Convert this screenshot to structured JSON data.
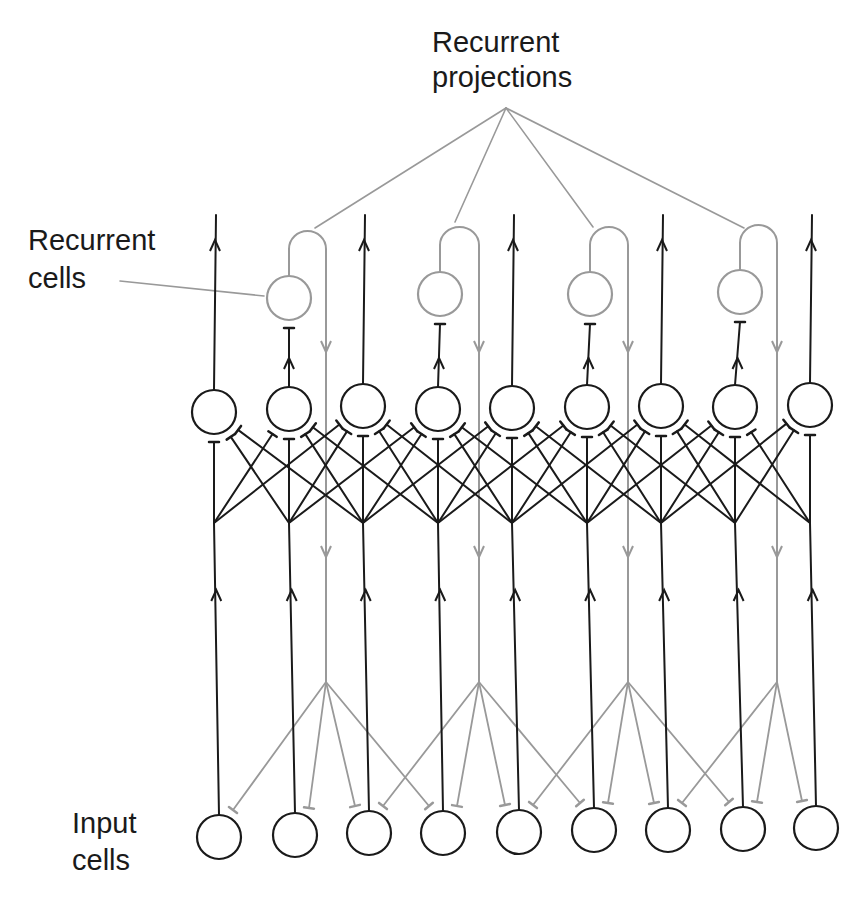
{
  "labels": {
    "recurrent_projections": [
      "Recurrent",
      "projections"
    ],
    "recurrent_cells": [
      "Recurrent",
      "cells"
    ],
    "input_cells": [
      "Input",
      "cells"
    ]
  },
  "colors": {
    "primary_stroke": "#1a1a1a",
    "recurrent_stroke": "#999999"
  },
  "layout": {
    "middle_cells_x": [
      214,
      289,
      363,
      438,
      512,
      587,
      661,
      735,
      810
    ],
    "middle_cells_y": [
      412,
      409,
      406,
      409,
      408,
      407,
      406,
      407,
      405
    ],
    "input_cells_x": [
      219,
      295,
      369,
      443,
      519,
      594,
      668,
      743,
      816
    ],
    "input_cells_y": [
      837,
      835,
      833,
      833,
      832,
      830,
      830,
      829,
      828
    ],
    "recurrent_cells": [
      {
        "x": 289,
        "y": 298,
        "loop_x": 326,
        "source_col": 1
      },
      {
        "x": 440,
        "y": 294,
        "loop_x": 479,
        "source_col": 3
      },
      {
        "x": 590,
        "y": 294,
        "loop_x": 628,
        "source_col": 5
      },
      {
        "x": 740,
        "y": 292,
        "loop_x": 777,
        "source_col": 7
      }
    ],
    "projection_apex": {
      "x": 506,
      "y": 108
    },
    "projection_targets": [
      [
        315,
        228
      ],
      [
        455,
        222
      ],
      [
        593,
        227
      ],
      [
        744,
        228
      ]
    ],
    "cell_radius": 22,
    "recurrent_branch_y": 682
  }
}
